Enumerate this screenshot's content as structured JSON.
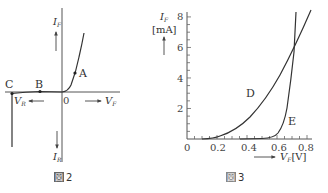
{
  "figure2": {
    "caption_num": "2",
    "caption_prefix": "図",
    "y_pos_label": "I",
    "y_pos_sub": "F",
    "y_neg_label": "I",
    "y_neg_sub": "R",
    "x_pos_label": "V",
    "x_pos_sub": "F",
    "x_neg_label": "V",
    "x_neg_sub": "R",
    "origin": "0",
    "points": [
      {
        "name": "A",
        "x": 75,
        "y": 73
      },
      {
        "name": "B",
        "x": 40,
        "y": 91.5
      },
      {
        "name": "C",
        "x": 12,
        "y": 93.5
      }
    ]
  },
  "figure3": {
    "caption_prefix": "図",
    "caption_num": "3",
    "y_label": "I",
    "y_sub": "F",
    "y_unit": "[mA]",
    "x_label": "V",
    "x_sub": "F",
    "x_unit": "[V]",
    "x_ticks": [
      "0",
      "0.2",
      "0.4",
      "0.6",
      "0.8"
    ],
    "y_ticks": [
      "2",
      "4",
      "6",
      "8"
    ],
    "curve_labels": [
      "D",
      "E"
    ]
  },
  "chart_data": {
    "type": "line",
    "xlabel": "V_F [V]",
    "ylabel": "I_F [mA]",
    "xlim": [
      0,
      0.8
    ],
    "ylim": [
      0,
      8
    ],
    "x_ticks": [
      0,
      0.2,
      0.4,
      0.6,
      0.8
    ],
    "y_ticks": [
      2,
      4,
      6,
      8
    ],
    "series": [
      {
        "name": "D",
        "x": [
          0.1,
          0.2,
          0.3,
          0.4,
          0.5,
          0.6,
          0.7,
          0.8
        ],
        "values": [
          0.0,
          0.2,
          0.9,
          2.1,
          3.5,
          5.0,
          6.6,
          8.2
        ]
      },
      {
        "name": "E",
        "x": [
          0.4,
          0.5,
          0.55,
          0.6,
          0.65,
          0.7,
          0.72
        ],
        "values": [
          0.0,
          0.1,
          0.3,
          0.8,
          2.5,
          6.6,
          8.5
        ]
      }
    ]
  }
}
